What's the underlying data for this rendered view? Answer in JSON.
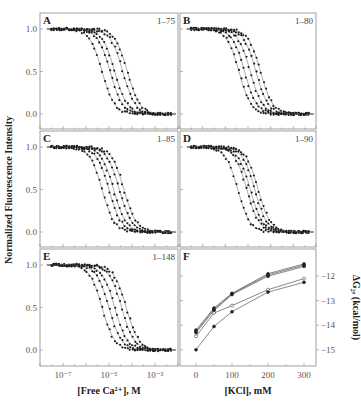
{
  "figure": {
    "ylabel_left": "Normalized Fluorescence Intensity",
    "ylabel_right": "ΔG₂, (kcal/mol)",
    "xlabel_left": "[Free Ca²⁺], M",
    "xlabel_right": "[KCl], mM"
  },
  "chart_data": [
    {
      "panel": "A",
      "annotation": "1–75",
      "type": "scatter",
      "xscale": "log",
      "xlim": [
        1e-08,
        0.01
      ],
      "ylim": [
        -0.2,
        1.1
      ],
      "yticks": [
        "1.0",
        "0.5",
        "0.0"
      ],
      "series": [
        {
          "name": "curve1",
          "midpoint_log10": -5.3,
          "hill": 1.6
        },
        {
          "name": "curve2",
          "midpoint_log10": -4.95,
          "hill": 1.6
        },
        {
          "name": "curve3",
          "midpoint_log10": -4.75,
          "hill": 1.6
        },
        {
          "name": "curve4",
          "midpoint_log10": -4.4,
          "hill": 1.6
        },
        {
          "name": "curve5",
          "midpoint_log10": -4.2,
          "hill": 1.6
        }
      ]
    },
    {
      "panel": "B",
      "annotation": "1–80",
      "type": "scatter",
      "xscale": "log",
      "xlim": [
        1e-08,
        0.01
      ],
      "ylim": [
        -0.2,
        1.1
      ],
      "series": [
        {
          "name": "curve1",
          "midpoint_log10": -5.4,
          "hill": 1.6
        },
        {
          "name": "curve2",
          "midpoint_log10": -5.15,
          "hill": 1.6
        },
        {
          "name": "curve3",
          "midpoint_log10": -4.9,
          "hill": 1.6
        },
        {
          "name": "curve4",
          "midpoint_log10": -4.65,
          "hill": 1.6
        },
        {
          "name": "curve5",
          "midpoint_log10": -4.45,
          "hill": 1.6
        }
      ]
    },
    {
      "panel": "C",
      "annotation": "1–85",
      "type": "scatter",
      "xscale": "log",
      "xlim": [
        1e-08,
        0.01
      ],
      "ylim": [
        -0.2,
        1.1
      ],
      "yticks": [
        "1.0",
        "0.5",
        "0.0"
      ],
      "series": [
        {
          "name": "curve1",
          "midpoint_log10": -5.3,
          "hill": 1.6
        },
        {
          "name": "curve2",
          "midpoint_log10": -5.0,
          "hill": 1.6
        },
        {
          "name": "curve3",
          "midpoint_log10": -4.8,
          "hill": 1.6
        },
        {
          "name": "curve4",
          "midpoint_log10": -4.55,
          "hill": 1.6
        },
        {
          "name": "curve5",
          "midpoint_log10": -4.35,
          "hill": 1.6
        }
      ]
    },
    {
      "panel": "D",
      "annotation": "1–90",
      "type": "scatter",
      "xscale": "log",
      "xlim": [
        1e-08,
        0.01
      ],
      "ylim": [
        -0.2,
        1.1
      ],
      "series": [
        {
          "name": "curve1",
          "midpoint_log10": -5.45,
          "hill": 1.6
        },
        {
          "name": "curve2",
          "midpoint_log10": -5.05,
          "hill": 1.6
        },
        {
          "name": "curve3",
          "midpoint_log10": -4.9,
          "hill": 1.6
        },
        {
          "name": "curve4",
          "midpoint_log10": -4.7,
          "hill": 1.6
        },
        {
          "name": "curve5",
          "midpoint_log10": -4.55,
          "hill": 1.6
        }
      ]
    },
    {
      "panel": "E",
      "annotation": "1–148",
      "type": "scatter",
      "xscale": "log",
      "xlim": [
        1e-08,
        0.01
      ],
      "ylim": [
        -0.2,
        1.1
      ],
      "yticks": [
        "1.0",
        "0.5",
        "0.0"
      ],
      "xticks": [
        "10⁻⁷",
        "10⁻⁵",
        "10⁻³"
      ],
      "xlabel": "[Free Ca²⁺], M",
      "series": [
        {
          "name": "curve1",
          "midpoint_log10": -5.3,
          "hill": 1.6
        },
        {
          "name": "curve2",
          "midpoint_log10": -5.0,
          "hill": 1.6
        },
        {
          "name": "curve3",
          "midpoint_log10": -4.75,
          "hill": 1.6
        },
        {
          "name": "curve4",
          "midpoint_log10": -4.45,
          "hill": 1.6
        },
        {
          "name": "curve5",
          "midpoint_log10": -4.25,
          "hill": 1.6
        }
      ]
    },
    {
      "panel": "F",
      "type": "line",
      "x": [
        0,
        50,
        100,
        200,
        300
      ],
      "xticks": [
        "0",
        "100",
        "200",
        "300"
      ],
      "xlabel": "[KCl], mM",
      "ylabel": "ΔG₂, (kcal/mol)",
      "ylim": [
        -15.5,
        -11.3
      ],
      "yticks": [
        "-12",
        "-13",
        "-14",
        "-15"
      ],
      "series": [
        {
          "name": "1–75",
          "values": [
            -14.2,
            -13.3,
            -12.7,
            -11.9,
            -11.5
          ]
        },
        {
          "name": "1–80",
          "values": [
            -14.25,
            -13.35,
            -12.72,
            -11.95,
            -11.55
          ]
        },
        {
          "name": "1–85",
          "values": [
            -14.3,
            -13.4,
            -12.75,
            -12.0,
            -11.6
          ]
        },
        {
          "name": "1–90",
          "values": [
            -14.45,
            -13.5,
            -13.2,
            -12.55,
            -12.1
          ]
        },
        {
          "name": "1–148",
          "values": [
            -15.0,
            -14.05,
            -13.45,
            -12.65,
            -12.25
          ]
        }
      ]
    }
  ]
}
